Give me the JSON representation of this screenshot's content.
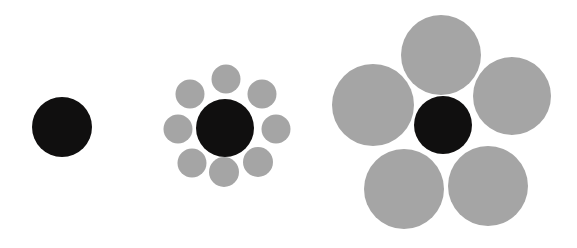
{
  "canvas": {
    "width": 577,
    "height": 248,
    "background_color": "#ffffff"
  },
  "palette": {
    "target_color": "#100f0f",
    "inducer_color": "#a5a5a5",
    "background_color": "#ffffff"
  },
  "figure": {
    "type": "ebbinghaus-titchener-illusion",
    "group_count": 3
  },
  "chart_data": {
    "type": "scatter",
    "title": "",
    "subtitle": "",
    "xlabel": "",
    "ylabel": "",
    "grid": false,
    "legend": null,
    "xlim": [
      0,
      577
    ],
    "ylim": [
      0,
      248
    ],
    "units": "pixels",
    "series": [
      {
        "name": "target-circles",
        "color": "#100f0f",
        "role": "central target circle (identical size in all three groups)",
        "values": [
          {
            "group": "left",
            "cx": 62,
            "cy": 127,
            "d": 60
          },
          {
            "group": "middle",
            "cx": 225,
            "cy": 128,
            "d": 58
          },
          {
            "group": "right",
            "cx": 443,
            "cy": 125,
            "d": 58
          }
        ]
      },
      {
        "name": "inducer-circles-middle",
        "color": "#a5a5a5",
        "role": "eight small surrounding circles",
        "count": 8,
        "diameter": 29,
        "values": [
          {
            "cx": 190,
            "cy": 94,
            "d": 29
          },
          {
            "cx": 226,
            "cy": 79,
            "d": 29
          },
          {
            "cx": 262,
            "cy": 94,
            "d": 29
          },
          {
            "cx": 276,
            "cy": 129,
            "d": 29
          },
          {
            "cx": 258,
            "cy": 162,
            "d": 30
          },
          {
            "cx": 224,
            "cy": 172,
            "d": 30
          },
          {
            "cx": 192,
            "cy": 163,
            "d": 29
          },
          {
            "cx": 178,
            "cy": 129,
            "d": 29
          }
        ]
      },
      {
        "name": "inducer-circles-right",
        "color": "#a5a5a5",
        "role": "five large surrounding circles",
        "count": 5,
        "diameter": 80,
        "values": [
          {
            "cx": 441,
            "cy": 55,
            "d": 80
          },
          {
            "cx": 512,
            "cy": 96,
            "d": 78
          },
          {
            "cx": 488,
            "cy": 186,
            "d": 80
          },
          {
            "cx": 404,
            "cy": 189,
            "d": 80
          },
          {
            "cx": 373,
            "cy": 105,
            "d": 82
          }
        ]
      }
    ],
    "annotations": []
  },
  "groups": [
    {
      "id": "left",
      "label": "isolated-target",
      "inducer_count": 0
    },
    {
      "id": "middle",
      "label": "target-with-small-inducers",
      "inducer_count": 8
    },
    {
      "id": "right",
      "label": "target-with-large-inducers",
      "inducer_count": 5
    }
  ]
}
